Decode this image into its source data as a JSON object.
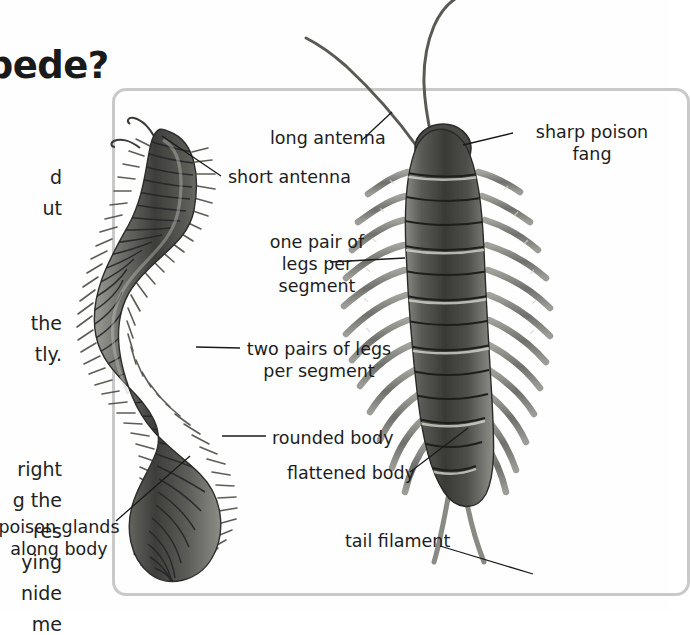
{
  "page": {
    "background_color": "#ffffff",
    "frame_color": "#c9c9c9",
    "text_color": "#1d1d1d"
  },
  "heading": {
    "text": "…ipede?"
  },
  "body_text": {
    "paragraphs": [
      "d\nut",
      " the\ntly.",
      "right\ng the\nres\nying\nnide\nme"
    ],
    "line_1": "d",
    "line_2": "ut",
    "line_3": " the",
    "line_4": "tly.",
    "line_5": "right",
    "line_6": "g the",
    "line_7": "res",
    "line_8": "ying",
    "line_9": "ide",
    "line_10": "me"
  },
  "figure": {
    "type": "illustration",
    "specimens": [
      {
        "name": "millipede",
        "position": "left",
        "body_shape": "rounded",
        "legs": "two pairs per segment"
      },
      {
        "name": "centipede",
        "position": "right",
        "body_shape": "flattened",
        "legs": "one pair per segment"
      }
    ],
    "labels": [
      {
        "id": "long-antenna",
        "text": "long antenna",
        "target": "centipede"
      },
      {
        "id": "short-antenna",
        "text": "short antenna",
        "target": "millipede"
      },
      {
        "id": "sharp-fang",
        "text": "sharp poison\nfang",
        "target": "centipede"
      },
      {
        "id": "one-pair",
        "text": "one pair of\nlegs per\nsegment",
        "target": "centipede"
      },
      {
        "id": "two-pairs",
        "text": "two pairs of legs\nper segment",
        "target": "millipede"
      },
      {
        "id": "rounded-body",
        "text": "rounded body",
        "target": "millipede"
      },
      {
        "id": "flattened-body",
        "text": "flattened body",
        "target": "centipede"
      },
      {
        "id": "tail-filament",
        "text": "tail filament",
        "target": "centipede"
      },
      {
        "id": "poison-glands",
        "text": "poison glands\nalong body",
        "target": "millipede"
      }
    ]
  }
}
